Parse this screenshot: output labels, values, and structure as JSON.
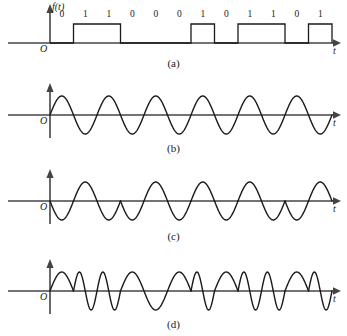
{
  "figure": {
    "width": 347,
    "height": 336,
    "stroke_color": "#1a1a1a",
    "background": "#ffffff"
  },
  "axes": {
    "time_label": "t",
    "origin_label": "O",
    "function_label": "f(t)"
  },
  "panels": [
    {
      "id": "a",
      "caption": "(a)",
      "kind": "digital-baseband",
      "description": "binary NRZ data signal"
    },
    {
      "id": "b",
      "caption": "(b)",
      "kind": "carrier-sine",
      "description": "unmodulated sinusoidal carrier"
    },
    {
      "id": "c",
      "caption": "(c)",
      "kind": "phase-shift-keying",
      "description": "phase modulated carrier with 180 degree phase reversals"
    },
    {
      "id": "d",
      "caption": "(d)",
      "kind": "frequency-shift-keying",
      "description": "frequency modulated carrier with two tone frequencies"
    }
  ],
  "chart_data": {
    "type": "line",
    "xlabel": "t",
    "ylabel": "f(t)",
    "grid": false,
    "legend": false,
    "bit_sequence": [
      0,
      1,
      1,
      0,
      0,
      0,
      1,
      0,
      1,
      1,
      0,
      1
    ],
    "bit_labels": [
      "0",
      "1",
      "1",
      "0",
      "0",
      "0",
      "1",
      "0",
      "1",
      "1",
      "0",
      "1"
    ],
    "bit_count": 12,
    "panel_a": {
      "type": "step",
      "name": "binary data f(t)",
      "levels": [
        0,
        1,
        1,
        0,
        0,
        0,
        1,
        0,
        1,
        1,
        0,
        1
      ],
      "high_value": 1,
      "low_value": 0
    },
    "panel_b": {
      "type": "line",
      "name": "carrier",
      "cycles": 6,
      "amplitude": 1,
      "phase_deg": 0
    },
    "panel_c": {
      "type": "line",
      "name": "PSK",
      "cycles_per_bit": 0.5,
      "phase_deg_per_bit": [
        180,
        0,
        0,
        180,
        180,
        180,
        0,
        180,
        0,
        0,
        180,
        0
      ],
      "amplitude": 1
    },
    "panel_d": {
      "type": "line",
      "name": "FSK",
      "cycles_per_bit": [
        0.5,
        1,
        1,
        0.5,
        0.5,
        0.5,
        1,
        0.5,
        1,
        1,
        0.5,
        1
      ],
      "amplitude": 1
    },
    "axis_ranges": {
      "x_start_px": 50,
      "x_end_px": 332,
      "bit_width_px": 23.5
    }
  }
}
